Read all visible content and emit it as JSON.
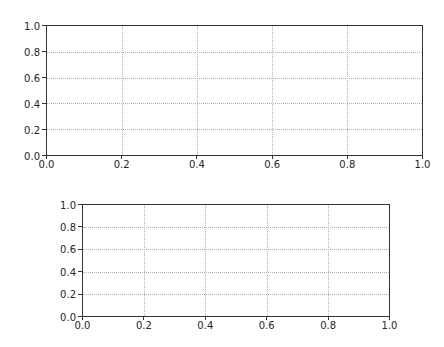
{
  "chart_data": [
    {
      "type": "line",
      "title": "",
      "xlabel": "",
      "ylabel": "",
      "xlim": [
        0.0,
        1.0
      ],
      "ylim": [
        0.0,
        1.0
      ],
      "grid": true,
      "series": [],
      "xticks": [
        "0.0",
        "0.2",
        "0.4",
        "0.6",
        "0.8",
        "1.0"
      ],
      "yticks": [
        "0.0",
        "0.2",
        "0.4",
        "0.6",
        "0.8",
        "1.0"
      ],
      "legend": null
    },
    {
      "type": "line",
      "title": "",
      "xlabel": "",
      "ylabel": "",
      "xlim": [
        0.0,
        1.0
      ],
      "ylim": [
        0.0,
        1.0
      ],
      "grid": true,
      "series": [],
      "xticks": [
        "0.0",
        "0.2",
        "0.4",
        "0.6",
        "0.8",
        "1.0"
      ],
      "yticks": [
        "0.0",
        "0.2",
        "0.4",
        "0.6",
        "0.8",
        "1.0"
      ],
      "legend": null
    }
  ],
  "axes": [
    {
      "box": {
        "left": 46,
        "top": 25,
        "width": 377,
        "height": 131
      },
      "xticks": [
        "0.0",
        "0.2",
        "0.4",
        "0.6",
        "0.8",
        "1.0"
      ],
      "yticks": [
        "0.0",
        "0.2",
        "0.4",
        "0.6",
        "0.8",
        "1.0"
      ]
    },
    {
      "box": {
        "left": 82,
        "top": 204,
        "width": 308,
        "height": 113
      },
      "xticks": [
        "0.0",
        "0.2",
        "0.4",
        "0.6",
        "0.8",
        "1.0"
      ],
      "yticks": [
        "0.0",
        "0.2",
        "0.4",
        "0.6",
        "0.8",
        "1.0"
      ]
    }
  ],
  "colors": {
    "spine": "#333333",
    "grid": "#b0b0b0",
    "text": "#262626",
    "background": "#ffffff"
  }
}
